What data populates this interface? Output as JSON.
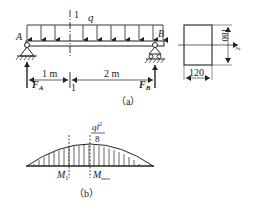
{
  "figure_a": {
    "caption": "（a）",
    "section_label_top": "1",
    "section_label_bottom": "1",
    "load_label": "q",
    "support_a_label": "A",
    "support_b_label": "B",
    "reaction_a_label": "F",
    "reaction_a_sub": "A",
    "reaction_b_label": "F",
    "reaction_b_sub": "B",
    "dim_left": "1 m",
    "dim_right": "2 m",
    "cross_section": {
      "height_label": "180",
      "width_label": "120",
      "axis_label": "z"
    }
  },
  "figure_b": {
    "caption": "（b）",
    "peak_numerator_q": "q",
    "peak_numerator_l": "l",
    "peak_numerator_exp": "2",
    "peak_denominator": "8",
    "m1_label": "M",
    "m1_sub": "1",
    "mmax_label": "M",
    "mmax_sub": "max"
  }
}
